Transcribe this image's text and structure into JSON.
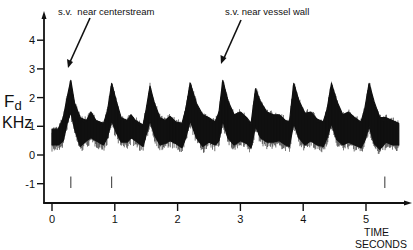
{
  "chart_data": {
    "type": "line",
    "title": "",
    "xlabel": "TIME SECONDS",
    "xlabel_lines": [
      "TIME",
      "SECONDS"
    ],
    "ylabel": "Fd KHz",
    "ylabel_main": "F",
    "ylabel_sub": "d",
    "ylabel_unit": "KHz",
    "xlim": [
      -0.1,
      5.75
    ],
    "ylim": [
      -1.7,
      4.9
    ],
    "x_ticks": [
      0,
      1,
      2,
      3,
      4,
      5
    ],
    "x_tick_labels": [
      "0",
      "1",
      "2",
      "3",
      "4",
      "5"
    ],
    "y_ticks": [
      4,
      3,
      2,
      1,
      0,
      -1
    ],
    "y_tick_labels": [
      "4",
      "3",
      "2",
      "1",
      "0",
      "-1"
    ],
    "grid": false,
    "legend": null,
    "annotations": [
      {
        "text": "s.v.  near centerstream",
        "x_text": 0.35,
        "y_text": 4.95,
        "arrow_to_x": 0.3,
        "arrow_to_y": 3.0
      },
      {
        "text": "s.v. near vessel wall",
        "x_text": 2.75,
        "y_text": 4.95,
        "arrow_to_x": 2.6,
        "arrow_to_y": 2.9
      }
    ],
    "series": [
      {
        "name": "Doppler shift envelope (upper)",
        "x": [
          0.0,
          0.1,
          0.18,
          0.24,
          0.3,
          0.36,
          0.45,
          0.55,
          0.62,
          0.7,
          0.82,
          0.88,
          0.95,
          1.02,
          1.1,
          1.2,
          1.26,
          1.33,
          1.45,
          1.5,
          1.56,
          1.63,
          1.72,
          1.8,
          1.88,
          1.97,
          2.07,
          2.13,
          2.2,
          2.3,
          2.4,
          2.5,
          2.6,
          2.66,
          2.72,
          2.8,
          2.9,
          3.0,
          3.1,
          3.17,
          3.24,
          3.32,
          3.42,
          3.52,
          3.62,
          3.72,
          3.78,
          3.85,
          3.93,
          4.03,
          4.12,
          4.22,
          4.32,
          4.38,
          4.45,
          4.53,
          4.63,
          4.72,
          4.82,
          4.92,
          4.98,
          5.05,
          5.13,
          5.22,
          5.32,
          5.42,
          5.52
        ],
        "values": [
          0.9,
          0.9,
          1.3,
          2.0,
          2.6,
          1.8,
          1.3,
          1.2,
          1.5,
          1.2,
          1.1,
          1.5,
          2.5,
          1.9,
          1.3,
          1.2,
          1.4,
          1.2,
          1.05,
          1.6,
          2.4,
          1.8,
          1.3,
          1.2,
          1.35,
          1.15,
          1.1,
          1.6,
          2.5,
          1.8,
          1.4,
          1.3,
          1.15,
          1.5,
          2.6,
          1.9,
          1.4,
          1.5,
          1.3,
          1.1,
          2.3,
          1.85,
          1.5,
          1.4,
          1.4,
          1.2,
          1.15,
          2.5,
          1.9,
          1.45,
          1.5,
          1.25,
          1.15,
          1.6,
          2.5,
          1.9,
          1.4,
          1.5,
          1.3,
          1.15,
          1.6,
          2.5,
          1.85,
          1.3,
          1.3,
          1.2,
          1.1
        ]
      },
      {
        "name": "Doppler shift envelope (lower)",
        "x": [
          0.0,
          0.1,
          0.18,
          0.24,
          0.3,
          0.36,
          0.45,
          0.55,
          0.62,
          0.7,
          0.82,
          0.88,
          0.95,
          1.02,
          1.1,
          1.2,
          1.26,
          1.33,
          1.45,
          1.5,
          1.56,
          1.63,
          1.72,
          1.8,
          1.88,
          1.97,
          2.07,
          2.13,
          2.2,
          2.3,
          2.4,
          2.5,
          2.6,
          2.66,
          2.72,
          2.8,
          2.9,
          3.0,
          3.1,
          3.17,
          3.24,
          3.32,
          3.42,
          3.52,
          3.62,
          3.72,
          3.78,
          3.85,
          3.93,
          4.03,
          4.12,
          4.22,
          4.32,
          4.38,
          4.45,
          4.53,
          4.63,
          4.72,
          4.82,
          4.92,
          4.98,
          5.05,
          5.13,
          5.22,
          5.32,
          5.42,
          5.52
        ],
        "values": [
          0.35,
          0.35,
          0.5,
          1.1,
          1.5,
          0.9,
          0.3,
          0.5,
          0.6,
          0.5,
          0.35,
          0.6,
          1.2,
          0.8,
          0.45,
          0.45,
          0.6,
          0.5,
          0.3,
          0.7,
          1.2,
          0.7,
          0.35,
          0.4,
          0.5,
          0.4,
          0.25,
          0.6,
          1.2,
          0.6,
          0.3,
          0.45,
          0.35,
          0.5,
          1.2,
          0.6,
          0.35,
          0.5,
          0.4,
          0.25,
          1.0,
          0.6,
          0.45,
          0.45,
          0.5,
          0.35,
          0.3,
          1.1,
          0.6,
          0.35,
          0.5,
          0.35,
          0.3,
          0.6,
          1.1,
          0.55,
          0.35,
          0.45,
          0.35,
          0.25,
          0.5,
          1.0,
          0.4,
          0.2,
          0.45,
          0.35,
          0.35
        ]
      }
    ],
    "peaks_t": [
      0.3,
      0.95,
      1.56,
      2.2,
      2.72,
      3.24,
      3.85,
      4.45,
      5.05
    ],
    "peak_kHz": [
      2.6,
      2.5,
      2.4,
      2.5,
      2.6,
      2.3,
      2.5,
      2.5,
      2.5
    ],
    "baseline_kHz_range": [
      0.3,
      1.3
    ],
    "markers_at_minus1": [
      0.3,
      0.95,
      5.3
    ]
  },
  "labels": {
    "annotation_1": "s.v.  near centerstream",
    "annotation_2": "s.v. near vessel wall",
    "ylabel_main": "F",
    "ylabel_sub": "d",
    "ylabel_unit": "KHz",
    "xlabel_line1": "TIME",
    "xlabel_line2": "SECONDS"
  },
  "colors": {
    "ink": "#111111",
    "background": "#ffffff"
  }
}
